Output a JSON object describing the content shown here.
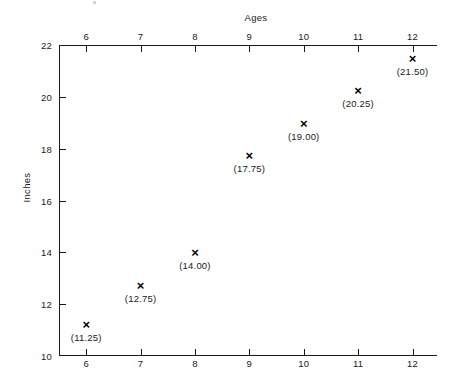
{
  "chart_data": {
    "type": "scatter",
    "title": "Ages",
    "xlabel": "Ages",
    "ylabel": "Inches",
    "x": [
      6,
      7,
      8,
      9,
      10,
      11,
      12
    ],
    "values": [
      11.25,
      12.75,
      14.0,
      17.75,
      19.0,
      20.25,
      21.5
    ],
    "point_labels": [
      "(11.25)",
      "(12.75)",
      "(14.00)",
      "(17.75)",
      "(19.00)",
      "(20.25)",
      "(21.50)"
    ],
    "marker": "×",
    "xlim": [
      5.5,
      12.45
    ],
    "ylim": [
      10,
      22
    ],
    "x_ticks": [
      6,
      7,
      8,
      9,
      10,
      11,
      12
    ],
    "x_tick_labels": [
      "6",
      "7",
      "8",
      "9",
      "10",
      "11",
      "12"
    ],
    "y_ticks": [
      10,
      12,
      14,
      16,
      18,
      20,
      22
    ],
    "y_tick_labels": [
      "10",
      "12",
      "14",
      "16",
      "18",
      "20",
      "22"
    ],
    "grid": false,
    "legend": false,
    "x_axis_position": "both",
    "colors": {
      "axis": "#1a1a1a",
      "marker": "#000000",
      "background": "#ffffff"
    }
  }
}
